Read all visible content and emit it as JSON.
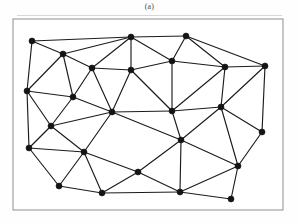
{
  "figure": {
    "caption": "(a)",
    "kind": "planar-triangulated-graph",
    "colors": {
      "background": "#ffffff",
      "frame_stroke": "#9a9a9a",
      "edge_stroke": "#1c1c1c",
      "node_fill": "#141414",
      "rule": "#d8d8d8"
    },
    "frame": {
      "x": 13,
      "y": 19,
      "width": 270,
      "height": 191
    },
    "node_radius": 3.0,
    "edge_width": 1.15
  },
  "chart_data": {
    "type": "scatter",
    "title": "(a)",
    "xlabel": "",
    "ylabel": "",
    "xlim": [
      0,
      299
    ],
    "ylim": [
      0,
      223
    ],
    "grid": false,
    "legend": "none",
    "node_count": 28,
    "edge_count": 67,
    "nodes": [
      {
        "id": 0,
        "x": 32,
        "y": 41
      },
      {
        "id": 1,
        "x": 63,
        "y": 54
      },
      {
        "id": 2,
        "x": 92,
        "y": 68
      },
      {
        "id": 3,
        "x": 131,
        "y": 37
      },
      {
        "id": 4,
        "x": 186,
        "y": 36
      },
      {
        "id": 5,
        "x": 131,
        "y": 70
      },
      {
        "id": 6,
        "x": 172,
        "y": 61
      },
      {
        "id": 7,
        "x": 225,
        "y": 67
      },
      {
        "id": 8,
        "x": 265,
        "y": 66
      },
      {
        "id": 9,
        "x": 27,
        "y": 91
      },
      {
        "id": 10,
        "x": 73,
        "y": 97
      },
      {
        "id": 11,
        "x": 112,
        "y": 112
      },
      {
        "id": 12,
        "x": 172,
        "y": 111
      },
      {
        "id": 13,
        "x": 221,
        "y": 107
      },
      {
        "id": 14,
        "x": 262,
        "y": 132
      },
      {
        "id": 15,
        "x": 51,
        "y": 126
      },
      {
        "id": 16,
        "x": 29,
        "y": 148
      },
      {
        "id": 17,
        "x": 84,
        "y": 152
      },
      {
        "id": 18,
        "x": 181,
        "y": 140
      },
      {
        "id": 19,
        "x": 238,
        "y": 166
      },
      {
        "id": 20,
        "x": 59,
        "y": 186
      },
      {
        "id": 21,
        "x": 102,
        "y": 193
      },
      {
        "id": 22,
        "x": 138,
        "y": 172
      },
      {
        "id": 23,
        "x": 180,
        "y": 192
      },
      {
        "id": 24,
        "x": 231,
        "y": 199
      }
    ],
    "edges": [
      [
        0,
        1
      ],
      [
        0,
        3
      ],
      [
        0,
        9
      ],
      [
        1,
        2
      ],
      [
        1,
        3
      ],
      [
        1,
        9
      ],
      [
        1,
        10
      ],
      [
        2,
        3
      ],
      [
        2,
        5
      ],
      [
        2,
        10
      ],
      [
        2,
        11
      ],
      [
        3,
        4
      ],
      [
        3,
        5
      ],
      [
        3,
        6
      ],
      [
        4,
        6
      ],
      [
        4,
        7
      ],
      [
        4,
        8
      ],
      [
        5,
        6
      ],
      [
        5,
        11
      ],
      [
        5,
        12
      ],
      [
        6,
        7
      ],
      [
        6,
        12
      ],
      [
        7,
        8
      ],
      [
        7,
        13
      ],
      [
        7,
        12
      ],
      [
        8,
        13
      ],
      [
        8,
        14
      ],
      [
        9,
        10
      ],
      [
        9,
        15
      ],
      [
        9,
        16
      ],
      [
        10,
        11
      ],
      [
        10,
        15
      ],
      [
        11,
        12
      ],
      [
        11,
        15
      ],
      [
        11,
        17
      ],
      [
        11,
        18
      ],
      [
        12,
        13
      ],
      [
        12,
        18
      ],
      [
        13,
        14
      ],
      [
        13,
        18
      ],
      [
        13,
        19
      ],
      [
        14,
        19
      ],
      [
        15,
        16
      ],
      [
        15,
        17
      ],
      [
        16,
        17
      ],
      [
        16,
        20
      ],
      [
        17,
        20
      ],
      [
        17,
        21
      ],
      [
        17,
        22
      ],
      [
        18,
        19
      ],
      [
        18,
        22
      ],
      [
        18,
        23
      ],
      [
        19,
        23
      ],
      [
        19,
        24
      ],
      [
        20,
        21
      ],
      [
        21,
        22
      ],
      [
        21,
        23
      ],
      [
        22,
        23
      ],
      [
        23,
        24
      ]
    ]
  }
}
